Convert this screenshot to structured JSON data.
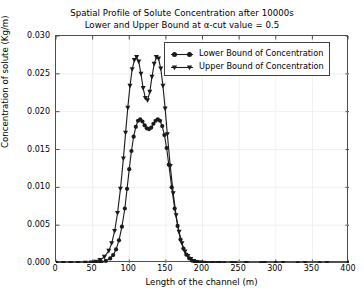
{
  "chart_data": {
    "type": "line",
    "title": "Spatial Profile of Solute Concentration after 10000s",
    "subtitle": "Lower and Upper Bound at α-cut value = 0.5",
    "xlabel": "Length of the channel (m)",
    "ylabel": "Concentration of solute (Kg/m)",
    "xlim": [
      0,
      400
    ],
    "ylim": [
      0.0,
      0.03
    ],
    "xticks": [
      0,
      50,
      100,
      150,
      200,
      250,
      300,
      350,
      400
    ],
    "yticks": [
      "0.000",
      "0.005",
      "0.010",
      "0.015",
      "0.020",
      "0.025",
      "0.030"
    ],
    "ytick_values": [
      0.0,
      0.005,
      0.01,
      0.015,
      0.02,
      0.025,
      0.03
    ],
    "grid": true,
    "grid_color": "#f0f0f0",
    "legend_position": "upper right",
    "series": [
      {
        "name": "Lower Bound of Concentration",
        "marker": "circle",
        "color": "#1a1a1a",
        "x": [
          0,
          10,
          20,
          30,
          40,
          50,
          56,
          62,
          68,
          74,
          78,
          82,
          86,
          90,
          94,
          97,
          100,
          103,
          106,
          109,
          112,
          115,
          118,
          121,
          124,
          127,
          130,
          133,
          136,
          139,
          142,
          145,
          148,
          151,
          154,
          158,
          162,
          166,
          170,
          174,
          178,
          182,
          186,
          190,
          194,
          198,
          204,
          212,
          220,
          230,
          245,
          260,
          280,
          300,
          330,
          360,
          400
        ],
        "y": [
          0.0,
          0.0,
          0.0,
          0.0,
          0.0,
          2e-05,
          5e-05,
          0.00012,
          0.00028,
          0.0006,
          0.00105,
          0.0018,
          0.003,
          0.0048,
          0.0072,
          0.0098,
          0.0124,
          0.0148,
          0.0167,
          0.018,
          0.0188,
          0.019,
          0.0187,
          0.0182,
          0.0178,
          0.0177,
          0.0179,
          0.0184,
          0.0188,
          0.019,
          0.0188,
          0.0181,
          0.0169,
          0.0152,
          0.013,
          0.01,
          0.0072,
          0.0049,
          0.0031,
          0.0019,
          0.0011,
          0.0006,
          0.0003,
          0.00015,
          7e-05,
          3e-05,
          1e-05,
          0.0,
          0.0,
          0.0,
          0.0,
          0.0,
          0.0,
          0.0,
          0.0,
          0.0,
          0.0
        ],
        "peak_value": 0.019,
        "peak_positions": [
          115,
          139
        ]
      },
      {
        "name": "Upper Bound of Concentration",
        "marker": "triangle-down",
        "color": "#1a1a1a",
        "x": [
          0,
          10,
          20,
          30,
          40,
          48,
          54,
          60,
          66,
          72,
          76,
          80,
          84,
          88,
          92,
          95,
          98,
          101,
          104,
          107,
          110,
          113,
          116,
          119,
          122,
          125,
          128,
          131,
          134,
          137,
          140,
          143,
          146,
          149,
          152,
          156,
          160,
          164,
          168,
          172,
          176,
          180,
          184,
          188,
          192,
          196,
          200,
          206,
          214,
          224,
          240,
          260,
          285,
          310,
          340,
          370,
          400
        ],
        "y": [
          0.0,
          0.0,
          0.0,
          0.0,
          2e-05,
          6e-05,
          0.00016,
          0.00038,
          0.0008,
          0.0016,
          0.0026,
          0.0042,
          0.0066,
          0.0098,
          0.0138,
          0.0172,
          0.0205,
          0.0234,
          0.0256,
          0.0268,
          0.0272,
          0.0266,
          0.025,
          0.0231,
          0.0218,
          0.0215,
          0.0226,
          0.0246,
          0.0263,
          0.0272,
          0.027,
          0.0257,
          0.0234,
          0.0204,
          0.017,
          0.0128,
          0.0092,
          0.0063,
          0.0041,
          0.0026,
          0.0015,
          0.0009,
          0.0005,
          0.00025,
          0.00012,
          5e-05,
          2e-05,
          0.0,
          0.0,
          0.0,
          0.0,
          0.0,
          0.0,
          0.0,
          0.0,
          0.0,
          0.0
        ],
        "peak_value": 0.0272,
        "peak_positions": [
          110,
          137
        ]
      }
    ]
  }
}
